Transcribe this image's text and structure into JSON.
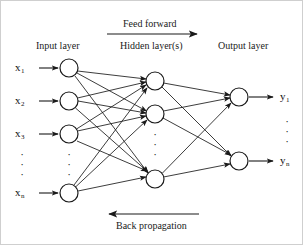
{
  "figure": {
    "title_top": "Feed forward",
    "title_bottom": "Back propagation",
    "layer_labels": {
      "input": "Input layer",
      "hidden": "Hidden layer(s)",
      "output": "Output layer"
    },
    "colors": {
      "stroke": "#1a1a1a",
      "node_fill": "#ffffff",
      "background": "#ffffff",
      "border": "#cfcfcf"
    },
    "inputs": [
      {
        "label": "x",
        "sub": "1"
      },
      {
        "label": "x",
        "sub": "2"
      },
      {
        "label": "x",
        "sub": "3"
      },
      {
        "label": "x",
        "sub": "n"
      }
    ],
    "outputs": [
      {
        "label": "y",
        "sub": "1"
      },
      {
        "label": "y",
        "sub": "n"
      }
    ],
    "ellipsis": {
      "glyph": "·",
      "count": 3
    },
    "topology": {
      "input_nodes": 4,
      "hidden_nodes": 3,
      "output_nodes": 2,
      "fully_connected": true
    },
    "geometry": {
      "node_radius": 9,
      "input_x": 68,
      "hidden_x": 154,
      "output_x": 238,
      "input_y": [
        67,
        100,
        133,
        192
      ],
      "hidden_y": [
        80,
        113,
        178
      ],
      "output_y": [
        96,
        160
      ]
    }
  }
}
